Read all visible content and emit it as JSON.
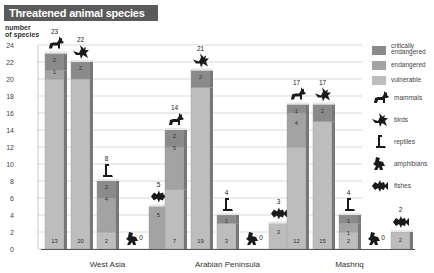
{
  "title": "Threatened animal species",
  "chart_data": {
    "type": "bar",
    "stacked": true,
    "title": "Threatened animal species",
    "ylabel": "number of species",
    "xlabel": "",
    "ylim": [
      0,
      24
    ],
    "yticks": [
      0,
      2,
      4,
      6,
      8,
      10,
      12,
      14,
      16,
      18,
      20,
      22,
      24
    ],
    "grid": true,
    "legend_position": "right",
    "groups": [
      "West Asia",
      "Arabian Peninsula",
      "Mashriq"
    ],
    "animal_classes": [
      "mammals",
      "birds",
      "reptiles",
      "amphibians",
      "fishes"
    ],
    "statuses": [
      "critically endangered",
      "endangered",
      "vulnerable"
    ],
    "status_colors": {
      "critically endangered": "#8a8a8a",
      "endangered": "#a3a3a3",
      "vulnerable": "#bdbdbd"
    },
    "bars": [
      {
        "group": "West Asia",
        "class": "mammals",
        "total": 23,
        "critically endangered": 2,
        "endangered": 1,
        "vulnerable": 20,
        "labels": [
          "2",
          "1",
          "13"
        ]
      },
      {
        "group": "West Asia",
        "class": "birds",
        "total": 22,
        "critically endangered": 2,
        "endangered": 0,
        "vulnerable": 20,
        "labels": [
          "2",
          "20"
        ]
      },
      {
        "group": "West Asia",
        "class": "reptiles",
        "total": 8,
        "critically endangered": 2,
        "endangered": 4,
        "vulnerable": 2,
        "labels": [
          "2",
          "4",
          "2"
        ]
      },
      {
        "group": "West Asia",
        "class": "amphibians",
        "total": 0,
        "critically endangered": 0,
        "endangered": 0,
        "vulnerable": 0,
        "labels": []
      },
      {
        "group": "West Asia",
        "class": "fishes",
        "total": 5,
        "critically endangered": 0,
        "endangered": 5,
        "vulnerable": 0,
        "labels": [
          "5"
        ]
      },
      {
        "group": "Arabian Peninsula",
        "class": "mammals",
        "total": 14,
        "critically endangered": 2,
        "endangered": 5,
        "vulnerable": 7,
        "labels": [
          "2",
          "5",
          "7"
        ]
      },
      {
        "group": "Arabian Peninsula",
        "class": "birds",
        "total": 21,
        "critically endangered": 2,
        "endangered": 0,
        "vulnerable": 19,
        "labels": [
          "2",
          "19"
        ]
      },
      {
        "group": "Arabian Peninsula",
        "class": "reptiles",
        "total": 4,
        "critically endangered": 1,
        "endangered": 0,
        "vulnerable": 3,
        "labels": [
          "1",
          "3"
        ]
      },
      {
        "group": "Arabian Peninsula",
        "class": "amphibians",
        "total": 0,
        "critically endangered": 0,
        "endangered": 0,
        "vulnerable": 0,
        "labels": []
      },
      {
        "group": "Arabian Peninsula",
        "class": "fishes",
        "total": 3,
        "critically endangered": 0,
        "endangered": 0,
        "vulnerable": 3,
        "labels": [
          "3"
        ]
      },
      {
        "group": "Mashriq",
        "class": "mammals",
        "total": 17,
        "critically endangered": 1,
        "endangered": 4,
        "vulnerable": 12,
        "labels": [
          "1",
          "4",
          "12"
        ]
      },
      {
        "group": "Mashriq",
        "class": "birds",
        "total": 17,
        "critically endangered": 2,
        "endangered": 0,
        "vulnerable": 15,
        "labels": [
          "2",
          "15"
        ]
      },
      {
        "group": "Mashriq",
        "class": "reptiles",
        "total": 4,
        "critically endangered": 1,
        "endangered": 1,
        "vulnerable": 2,
        "labels": [
          "1",
          "1",
          "2"
        ]
      },
      {
        "group": "Mashriq",
        "class": "amphibians",
        "total": 0,
        "critically endangered": 0,
        "endangered": 0,
        "vulnerable": 0,
        "labels": []
      },
      {
        "group": "Mashriq",
        "class": "fishes",
        "total": 2,
        "critically endangered": 0,
        "endangered": 0,
        "vulnerable": 2,
        "labels": [
          "2"
        ]
      }
    ],
    "legend": [
      {
        "label": "critically endangered",
        "kind": "swatch",
        "color": "#8a8a8a"
      },
      {
        "label": "endangered",
        "kind": "swatch",
        "color": "#a3a3a3"
      },
      {
        "label": "vulnerable",
        "kind": "swatch",
        "color": "#bdbdbd"
      },
      {
        "label": "mammals",
        "kind": "icon",
        "icon": "wolf-icon"
      },
      {
        "label": "birds",
        "kind": "icon",
        "icon": "bird-icon"
      },
      {
        "label": "reptiles",
        "kind": "icon",
        "icon": "reptile-icon"
      },
      {
        "label": "amphibians",
        "kind": "icon",
        "icon": "frog-icon"
      },
      {
        "label": "fishes",
        "kind": "icon",
        "icon": "fish-icon"
      }
    ]
  },
  "ylabel_line1": "number",
  "ylabel_line2": "of species"
}
